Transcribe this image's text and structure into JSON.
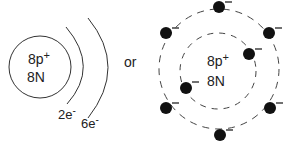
{
  "left_model": {
    "nucleus_line1": "8p+",
    "nucleus_line2": "8N",
    "shell1_label": "2e-",
    "shell2_label": "6e-"
  },
  "connector": "or",
  "right_model": {
    "nucleus_line1": "8p+",
    "nucleus_line2": "8N",
    "inner_electrons": 2,
    "outer_electrons": 6,
    "electron_charge": "-"
  }
}
